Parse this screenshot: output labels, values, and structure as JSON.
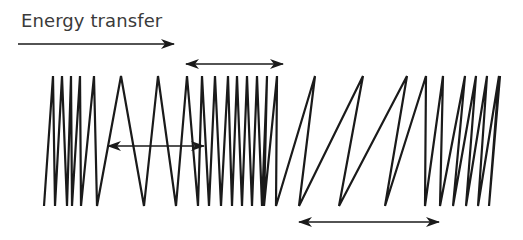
{
  "title": "Energy transfer",
  "colors": {
    "stroke": "#1a1a1a",
    "arrow": "#1a1a1a",
    "text": "#3a3a3a"
  },
  "energy_arrow": {
    "x1": 18,
    "x2": 174,
    "y": 44,
    "direction": "right"
  },
  "wavelength_arrows": [
    {
      "name": "compression-spacing",
      "x1": 186,
      "x2": 283,
      "y": 64
    },
    {
      "name": "middle-spacing",
      "x1": 108,
      "x2": 204,
      "y": 146
    },
    {
      "name": "rarefaction-spacing",
      "x1": 299,
      "x2": 439,
      "y": 222
    }
  ],
  "wave": {
    "y_top": 76,
    "y_bottom": 206,
    "vertices_x": [
      44,
      53,
      55,
      62,
      67,
      71,
      72,
      80,
      81,
      94,
      97,
      121,
      144,
      158,
      176,
      187,
      198,
      202,
      209,
      215,
      221,
      228,
      232,
      237,
      242,
      247,
      252,
      257,
      262,
      267,
      264,
      277,
      276,
      315,
      299,
      363,
      339,
      407,
      385,
      426,
      425,
      443,
      440,
      465,
      453,
      476,
      466,
      487,
      478,
      499,
      489,
      500
    ]
  }
}
